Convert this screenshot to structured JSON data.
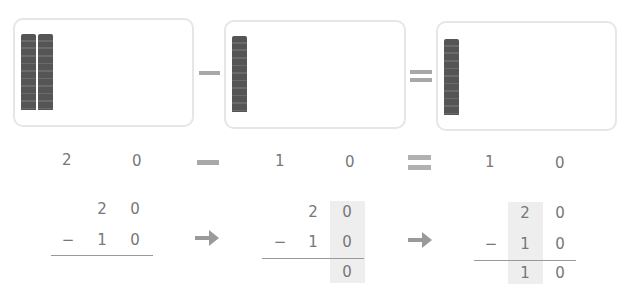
{
  "colors": {
    "rod": "#555555",
    "operator": "#a8a8a8",
    "digit": "#777777",
    "highlight": "#eeeeee",
    "box_border": "#e6e6e6"
  },
  "model": {
    "boxes": [
      {
        "label": "minuend",
        "tens_rods": 2,
        "ones": 0
      },
      {
        "label": "subtrahend",
        "tens_rods": 1,
        "ones": 0
      },
      {
        "label": "difference",
        "tens_rods": 1,
        "ones": 0
      }
    ],
    "operators": {
      "minus": "−",
      "equals": "="
    }
  },
  "equation": {
    "a": {
      "tens": "2",
      "ones": "0"
    },
    "b": {
      "tens": "1",
      "ones": "0"
    },
    "result": {
      "tens": "1",
      "ones": "0"
    }
  },
  "steps": [
    {
      "top": [
        "2",
        "0"
      ],
      "bottom": [
        "1",
        "0"
      ],
      "sign": "−",
      "answer": [
        "",
        ""
      ],
      "highlight": "none"
    },
    {
      "top": [
        "2",
        "0"
      ],
      "bottom": [
        "1",
        "0"
      ],
      "sign": "−",
      "answer": [
        "",
        "0"
      ],
      "highlight": "ones"
    },
    {
      "top": [
        "2",
        "0"
      ],
      "bottom": [
        "1",
        "0"
      ],
      "sign": "−",
      "answer": [
        "1",
        "0"
      ],
      "highlight": "tens"
    }
  ],
  "arrows": [
    "arrow-right",
    "arrow-right"
  ]
}
